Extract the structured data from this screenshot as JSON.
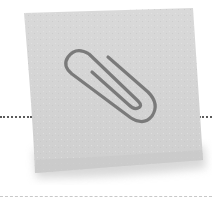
{
  "illustration": {
    "subject": "sticky-note-with-paperclip",
    "note_color": "#d6d6d6",
    "note_shadow_color": "#bdbdbd",
    "paperclip_color": "#7a7a7a",
    "dotted_line_color": "#5a5a5a",
    "dashed_line_color": "#c8c8c8",
    "background": "#ffffff"
  }
}
